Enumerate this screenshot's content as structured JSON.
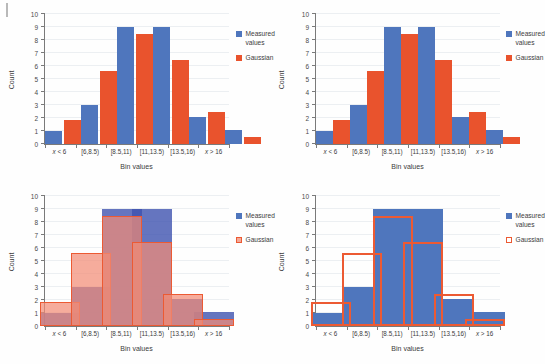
{
  "figure": {
    "panels": [
      {
        "id": "top-left",
        "mode": "grouped",
        "legend_gaussian_style": "solid"
      },
      {
        "id": "top-right",
        "mode": "adjacent",
        "legend_gaussian_style": "solid"
      },
      {
        "id": "bottom-left",
        "mode": "overlay",
        "legend_gaussian_style": "filled-outline"
      },
      {
        "id": "bottom-right",
        "mode": "outline",
        "legend_gaussian_style": "outline"
      }
    ]
  },
  "colors": {
    "measured_blue": "#4f76bd",
    "gaussian_red": "#e9532d",
    "gaussian_fill_light": "#f28c76",
    "gridline": "#eceff2",
    "axis": "#7a7a7a"
  },
  "chart_data": {
    "type": "bar",
    "title": "",
    "xlabel": "Bin values",
    "ylabel": "Count",
    "ylim": [
      0,
      10
    ],
    "yticks": [
      0,
      1,
      2,
      3,
      4,
      5,
      6,
      7,
      8,
      9,
      10
    ],
    "grid": true,
    "legend_position": "right",
    "categories": [
      "x < 6",
      "[6,8.5)",
      "[8.5,11)",
      "[11,13.5)",
      "[13.5,16)",
      "x > 16"
    ],
    "series": [
      {
        "name": "Measured values",
        "color": "#4f76bd",
        "values": [
          1,
          3,
          9,
          9,
          2.1,
          1.1
        ]
      },
      {
        "name": "Gaussian",
        "color": "#e9532d",
        "values": [
          1.85,
          5.6,
          8.45,
          6.45,
          2.5,
          0.55
        ]
      }
    ]
  },
  "legend": {
    "measured_line1": "Measured",
    "measured_line2": "values",
    "gaussian": "Gaussian"
  },
  "axis_titles": {
    "x": "Bin values",
    "y": "Count"
  }
}
